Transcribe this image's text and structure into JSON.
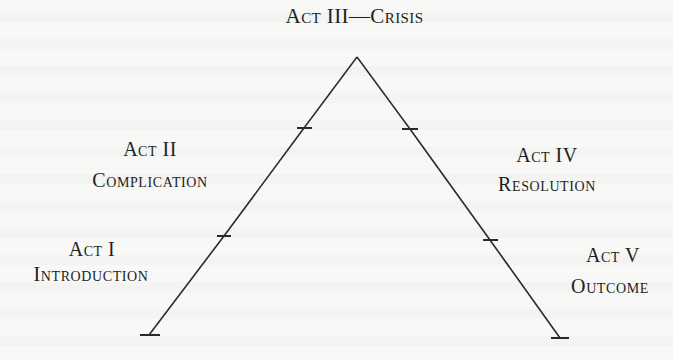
{
  "diagram": {
    "type": "dramatic-structure-pyramid",
    "title": "Act III—Crisis",
    "nodes": [
      {
        "id": "act1",
        "act": "Act I",
        "phase": "Introduction"
      },
      {
        "id": "act2",
        "act": "Act II",
        "phase": "Complication"
      },
      {
        "id": "act3",
        "act": "Act III",
        "phase": "Crisis",
        "combined_label": "Act III—Crisis"
      },
      {
        "id": "act4",
        "act": "Act IV",
        "phase": "Resolution"
      },
      {
        "id": "act5",
        "act": "Act V",
        "phase": "Outcome"
      }
    ],
    "edges": [
      {
        "from": "act1",
        "to": "act2"
      },
      {
        "from": "act2",
        "to": "act3"
      },
      {
        "from": "act3",
        "to": "act4"
      },
      {
        "from": "act4",
        "to": "act5"
      }
    ],
    "colors": {
      "ink": "#1e1e1e",
      "paper": "#f8f8f6"
    }
  }
}
